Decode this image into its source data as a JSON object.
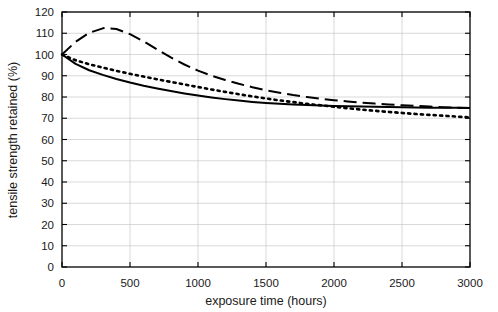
{
  "chart_data": {
    "type": "line",
    "title": "",
    "xlabel": "exposure time (hours)",
    "ylabel": "tensile strength retained (%)",
    "xlim": [
      0,
      3000
    ],
    "ylim": [
      0,
      120
    ],
    "xticks": [
      0,
      500,
      1000,
      1500,
      2000,
      2500,
      3000
    ],
    "yticks": [
      0,
      10,
      20,
      30,
      40,
      50,
      60,
      70,
      80,
      90,
      100,
      110,
      120
    ],
    "grid": true,
    "grid_color": "#c8c8c8",
    "legend": "none",
    "axis_color": "#000000",
    "series": [
      {
        "name": "long-dashed",
        "style": "dashed",
        "color": "#000000",
        "x": [
          0,
          100,
          200,
          300,
          320,
          400,
          500,
          600,
          700,
          800,
          900,
          1000,
          1100,
          1200,
          1300,
          1400,
          1500,
          1600,
          1700,
          1800,
          1900,
          2000,
          2100,
          2200,
          2300,
          2400,
          2500,
          2600,
          2700,
          2800,
          2900,
          3000
        ],
        "y": [
          100.0,
          106.0,
          110.2,
          112.3,
          112.5,
          112.0,
          109.6,
          106.2,
          102.3,
          98.6,
          95.3,
          92.4,
          90.0,
          88.0,
          86.2,
          84.6,
          83.2,
          82.0,
          80.9,
          80.0,
          79.2,
          78.5,
          77.9,
          77.4,
          76.9,
          76.5,
          76.1,
          75.8,
          75.5,
          75.2,
          75.0,
          74.8
        ]
      },
      {
        "name": "dotted",
        "style": "dotted",
        "color": "#000000",
        "x": [
          0,
          100,
          200,
          300,
          400,
          500,
          600,
          700,
          800,
          900,
          1000,
          1100,
          1200,
          1300,
          1400,
          1500,
          1600,
          1700,
          1800,
          1900,
          2000,
          2100,
          2200,
          2300,
          2400,
          2500,
          2600,
          2700,
          2800,
          2900,
          3000
        ],
        "y": [
          100.0,
          97.3,
          95.4,
          93.8,
          92.3,
          90.9,
          89.6,
          88.3,
          87.1,
          85.9,
          84.7,
          83.5,
          82.4,
          81.3,
          80.3,
          79.3,
          78.4,
          77.6,
          76.8,
          76.1,
          75.4,
          74.7,
          74.1,
          73.5,
          73.0,
          72.5,
          72.0,
          71.6,
          71.2,
          70.8,
          70.4
        ]
      },
      {
        "name": "solid",
        "style": "solid",
        "color": "#000000",
        "x": [
          0,
          100,
          200,
          300,
          400,
          500,
          600,
          700,
          800,
          900,
          1000,
          1100,
          1200,
          1300,
          1400,
          1500,
          1600,
          1700,
          1800,
          1900,
          2000,
          2100,
          2200,
          2300,
          2400,
          2500,
          2600,
          2700,
          2800,
          2900,
          3000
        ],
        "y": [
          100.0,
          95.6,
          92.6,
          90.4,
          88.5,
          86.8,
          85.3,
          84.0,
          82.8,
          81.7,
          80.7,
          79.8,
          79.0,
          78.3,
          77.7,
          77.2,
          76.8,
          76.5,
          76.2,
          76.0,
          75.8,
          75.6,
          75.5,
          75.4,
          75.3,
          75.2,
          75.1,
          75.0,
          74.9,
          74.9,
          74.8
        ]
      }
    ]
  },
  "axes": {
    "xlabel": "exposure time (hours)",
    "ylabel": "tensile strength retained (%)",
    "xtick_labels": [
      "0",
      "500",
      "1000",
      "1500",
      "2000",
      "2500",
      "3000"
    ],
    "ytick_labels": [
      "0",
      "10",
      "20",
      "30",
      "40",
      "50",
      "60",
      "70",
      "80",
      "90",
      "100",
      "110",
      "120"
    ]
  }
}
